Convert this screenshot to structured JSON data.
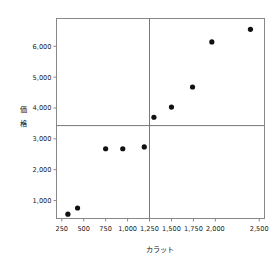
{
  "chart_data": {
    "type": "scatter",
    "title": "",
    "xlabel": "カラット",
    "ylabel": "価格",
    "ylabel_chars": [
      "価",
      "格"
    ],
    "xlim": [
      190,
      2560
    ],
    "ylim": [
      420,
      6900
    ],
    "grid": false,
    "legend": null,
    "x_ticks": [
      250,
      500,
      750,
      1000,
      1250,
      1500,
      1750,
      2000,
      2500
    ],
    "x_tick_labels": [
      "250",
      "500",
      "750",
      "1,000",
      "1,250",
      "1,500",
      "1,750",
      "2,000",
      "2,500"
    ],
    "y_ticks": [
      1000,
      2000,
      3000,
      4000,
      5000,
      6000
    ],
    "y_tick_labels": [
      "1,000",
      "2,000",
      "3,000",
      "4,000",
      "5,000",
      "6,000"
    ],
    "reference_lines": [
      {
        "orientation": "vertical",
        "value": 1250
      },
      {
        "orientation": "horizontal",
        "value": 3430
      }
    ],
    "points": [
      {
        "x": 320,
        "y": 560
      },
      {
        "x": 430,
        "y": 760
      },
      {
        "x": 750,
        "y": 2680
      },
      {
        "x": 945,
        "y": 2680
      },
      {
        "x": 1190,
        "y": 2740
      },
      {
        "x": 1300,
        "y": 3700
      },
      {
        "x": 1500,
        "y": 4030
      },
      {
        "x": 1740,
        "y": 4680
      },
      {
        "x": 1960,
        "y": 6140
      },
      {
        "x": 2400,
        "y": 6550
      }
    ],
    "marker": "filled-circle",
    "marker_color": "#111111"
  },
  "plot": {
    "frame_color": "#888888",
    "background": "#ffffff"
  }
}
